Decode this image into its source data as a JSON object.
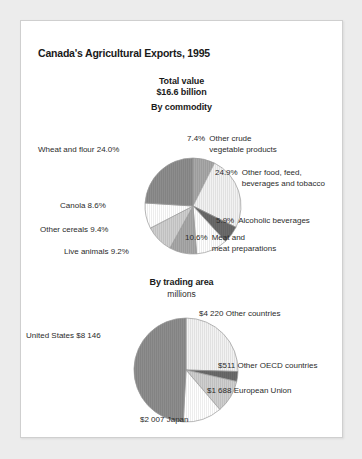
{
  "card": {
    "title": "Canada's Agricultural Exports, 1995",
    "total_value_label": "Total value",
    "total_value_amount": "$16.6 billion"
  },
  "colors": {
    "page_background": "#ececec",
    "card_background": "#ffffff",
    "card_border": "#cfcfcf",
    "text": "#2b2b2b",
    "slice_dark_gray": "#8d8d8d",
    "slice_medium_gray": "#a8a8a8",
    "slice_light_gray": "#cfcfcf",
    "slice_very_light": "#f2f2f2",
    "slice_white": "#ffffff",
    "slice_darkest": "#6b6b6b",
    "slice_outline": "#9a9a9a"
  },
  "chart_data": [
    {
      "type": "pie",
      "title": "By commodity",
      "subtitle": "",
      "units": "percent",
      "categories": [
        "Other crude vegetable products",
        "Other food, feed, beverages and tobacco",
        "Alcoholic beverages",
        "Meat and meat preparations",
        "Live animals",
        "Other cereals",
        "Canola",
        "Wheat and flour"
      ],
      "values": [
        7.4,
        24.9,
        5.9,
        10.6,
        9.2,
        9.4,
        8.6,
        24.0
      ],
      "value_labels": [
        "7.4%",
        "24.9%",
        "5.9%",
        "10.6%",
        "9.2%",
        "9.4%",
        "8.6%",
        "24.0%"
      ],
      "slice_colors": [
        "#a8a8a8",
        "#f2f2f2",
        "#6b6b6b",
        "#ffffff",
        "#a8a8a8",
        "#cfcfcf",
        "#ffffff",
        "#8d8d8d"
      ],
      "start_angle_deg": 0,
      "direction": "clockwise",
      "legend": "none",
      "grid": false,
      "labels": [
        {
          "pct": "7.4%",
          "name": "Other crude\nvegetable products"
        },
        {
          "pct": "24.9%",
          "name": "Other food, feed,\nbeverages and tobacco"
        },
        {
          "pct": "5.9%",
          "name": "Alcoholic beverages"
        },
        {
          "pct": "10.6%",
          "name": "Meat and\nmeat preparations"
        },
        {
          "pct": "9.2%",
          "name": "Live animals"
        },
        {
          "pct": "9.4%",
          "name": "Other cereals"
        },
        {
          "pct": "8.6%",
          "name": "Canola"
        },
        {
          "pct": "24.0%",
          "name": "Wheat and flour"
        }
      ],
      "label_texts": {
        "wheat": "Wheat and flour  24.0%",
        "canola": "Canola  8.6%",
        "other_cereals": "Other cereals  9.4%",
        "live_animals": "Live animals  9.2%",
        "crude_pct": "7.4%",
        "crude_name": "Other crude\nvegetable products",
        "otherfood_pct": "24.9%",
        "otherfood_name": "Other food, feed,\nbeverages and tobacco",
        "alcohol_pct": "5.9%",
        "alcohol_name": "Alcoholic beverages",
        "meat_pct": "10.6%",
        "meat_name": "Meat and\nmeat preparations"
      }
    },
    {
      "type": "pie",
      "title": "By trading area",
      "subtitle": "millions",
      "units": "millions of dollars",
      "categories": [
        "Other countries",
        "Other OECD countries",
        "European Union",
        "Japan",
        "United States"
      ],
      "values": [
        4220,
        511,
        1688,
        2007,
        8146
      ],
      "value_labels": [
        "$4 220",
        "$511",
        "$1 688",
        "$2 007",
        "$8 146"
      ],
      "slice_colors": [
        "#f2f2f2",
        "#6b6b6b",
        "#cfcfcf",
        "#ffffff",
        "#8d8d8d"
      ],
      "start_angle_deg": 0,
      "direction": "clockwise",
      "legend": "none",
      "grid": false,
      "labels": [
        {
          "value": "$4 220",
          "name": "Other countries"
        },
        {
          "value": "$511",
          "name": "Other OECD countries"
        },
        {
          "value": "$1 688",
          "name": "European Union"
        },
        {
          "value": "$2 007",
          "name": "Japan"
        },
        {
          "value": "$8 146",
          "name": "United States"
        }
      ],
      "label_texts": {
        "other_countries": "$4 220 Other countries",
        "other_oecd": "$511 Other OECD countries",
        "european_union": "$1 688 European Union",
        "japan": "$2 007 Japan",
        "united_states": "United States $8 146"
      }
    }
  ]
}
